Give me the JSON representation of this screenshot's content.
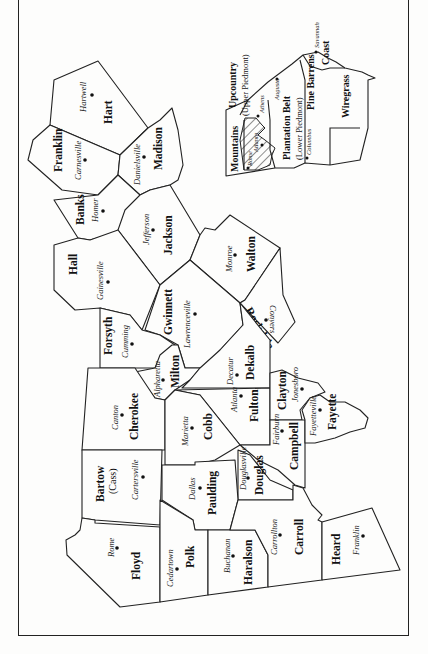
{
  "map": {
    "orientation": "rotated 90° counter-clockwise",
    "counties": [
      {
        "id": "hart",
        "name": "Hart",
        "seat": "Hartwell"
      },
      {
        "id": "franklin",
        "name": "Franklin",
        "seat": "Carnesville"
      },
      {
        "id": "madison",
        "name": "Madison",
        "seat": "Danielsville"
      },
      {
        "id": "banks",
        "name": "Banks",
        "seat": "Homer"
      },
      {
        "id": "jackson",
        "name": "Jackson",
        "seat": "Jefferson"
      },
      {
        "id": "hall",
        "name": "Hall",
        "seat": "Gainesville"
      },
      {
        "id": "walton",
        "name": "Walton",
        "seat": "Monroe"
      },
      {
        "id": "gwinnett",
        "name": "Gwinnett",
        "seat": "Lawrenceville"
      },
      {
        "id": "rockdale",
        "name": "Rockdale",
        "seat": "Conyers"
      },
      {
        "id": "forsyth",
        "name": "Forsyth",
        "seat": "Cumming"
      },
      {
        "id": "milton",
        "name": "Milton",
        "seat": "Alpharetta"
      },
      {
        "id": "dekalb",
        "name": "Dekalb",
        "seat": "Decatur"
      },
      {
        "id": "cherokee",
        "name": "Cherokee",
        "seat": "Canton"
      },
      {
        "id": "fulton",
        "name": "Fulton",
        "seat": "Atlanta"
      },
      {
        "id": "clayton",
        "name": "Clayton",
        "seat": "Jonesboro"
      },
      {
        "id": "cobb",
        "name": "Cobb",
        "seat": "Marietta"
      },
      {
        "id": "campbell",
        "name": "Campbell",
        "seat": "Fairburn"
      },
      {
        "id": "fayette",
        "name": "Fayette",
        "seat": "Fayetteville"
      },
      {
        "id": "bartow",
        "name": "Bartow",
        "alt_name": "(Cass)",
        "seat": "Cartersville"
      },
      {
        "id": "douglas",
        "name": "Douglas",
        "seat": "Douglasville"
      },
      {
        "id": "paulding",
        "name": "Paulding",
        "seat": "Dallas"
      },
      {
        "id": "floyd",
        "name": "Floyd",
        "seat": "Rome"
      },
      {
        "id": "polk",
        "name": "Polk",
        "seat": "Cedartown"
      },
      {
        "id": "haralson",
        "name": "Haralson",
        "seat": "Buchanan"
      },
      {
        "id": "carroll",
        "name": "Carroll",
        "seat": "Carrollton"
      },
      {
        "id": "heard",
        "name": "Heard",
        "seat": "Franklin"
      }
    ],
    "inset": {
      "title": "Georgia regions",
      "regions": [
        {
          "id": "mountains",
          "name": "Mountains"
        },
        {
          "id": "upcountry",
          "name": "Upcountry",
          "sub": "(Upper Piedmont)"
        },
        {
          "id": "plantation-belt",
          "name": "Plantation Belt",
          "sub": "(Lower Piedmont)"
        },
        {
          "id": "pine-barrens",
          "name": "Pine Barrens"
        },
        {
          "id": "wiregrass",
          "name": "Wiregrass"
        },
        {
          "id": "coast",
          "name": "Coast"
        }
      ],
      "cities": [
        "Rome",
        "Atlanta",
        "Athens",
        "Augusta",
        "Columbus",
        "Savannah"
      ],
      "hatched_area": "study counties"
    }
  }
}
